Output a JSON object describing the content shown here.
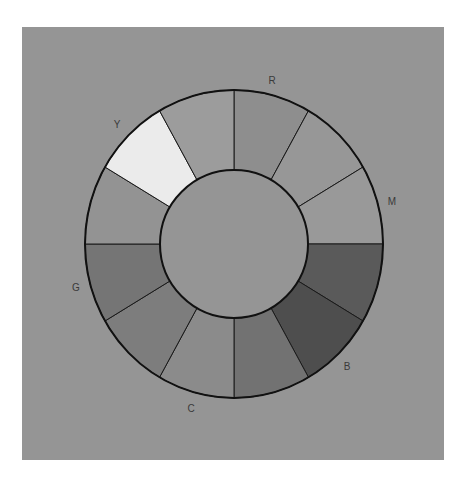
{
  "diagram": {
    "title": "",
    "type": "color-wheel",
    "page_background": "#ffffff",
    "panel": {
      "x": 22,
      "y": 27,
      "width": 422,
      "height": 433,
      "fill": "#959595"
    },
    "wheel": {
      "cx": 234,
      "cy": 244,
      "rx_outer": 149,
      "ry_outer": 154,
      "r_inner": 74,
      "outer_stroke": "#111111",
      "outer_stroke_width": 2,
      "divider_stroke": "#1a1a1a",
      "divider_stroke_width": 1,
      "inner_fill": "#959595",
      "segment_count": 12,
      "start_angle_deg": 0,
      "segments": [
        {
          "index": 0,
          "from_deg": 0,
          "to_deg": 30,
          "fill": "#8e8e8e",
          "hue": "R"
        },
        {
          "index": 1,
          "from_deg": 30,
          "to_deg": 60,
          "fill": "#979797",
          "hue": ""
        },
        {
          "index": 2,
          "from_deg": 60,
          "to_deg": 90,
          "fill": "#999999",
          "hue": "M"
        },
        {
          "index": 3,
          "from_deg": 90,
          "to_deg": 120,
          "fill": "#5a5a5a",
          "hue": ""
        },
        {
          "index": 4,
          "from_deg": 120,
          "to_deg": 150,
          "fill": "#4e4e4e",
          "hue": "B"
        },
        {
          "index": 5,
          "from_deg": 150,
          "to_deg": 180,
          "fill": "#727272",
          "hue": ""
        },
        {
          "index": 6,
          "from_deg": 180,
          "to_deg": 210,
          "fill": "#8b8b8b",
          "hue": "C"
        },
        {
          "index": 7,
          "from_deg": 210,
          "to_deg": 240,
          "fill": "#7d7d7d",
          "hue": ""
        },
        {
          "index": 8,
          "from_deg": 240,
          "to_deg": 270,
          "fill": "#757575",
          "hue": "G"
        },
        {
          "index": 9,
          "from_deg": 270,
          "to_deg": 300,
          "fill": "#939393",
          "hue": ""
        },
        {
          "index": 10,
          "from_deg": 300,
          "to_deg": 330,
          "fill": "#ebebeb",
          "hue": "Y"
        },
        {
          "index": 11,
          "from_deg": 330,
          "to_deg": 360,
          "fill": "#9c9c9c",
          "hue": ""
        }
      ]
    },
    "labels": [
      {
        "id": "R",
        "text": "R",
        "x": 272,
        "y": 84
      },
      {
        "id": "M",
        "text": "M",
        "x": 392,
        "y": 205
      },
      {
        "id": "B",
        "text": "B",
        "x": 347,
        "y": 370
      },
      {
        "id": "C",
        "text": "C",
        "x": 191,
        "y": 412
      },
      {
        "id": "G",
        "text": "G",
        "x": 76,
        "y": 291
      },
      {
        "id": "Y",
        "text": "Y",
        "x": 117,
        "y": 128
      }
    ]
  }
}
